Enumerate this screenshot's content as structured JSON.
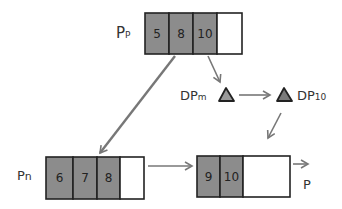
{
  "colors": {
    "filled": "#8c8c8c",
    "empty": "#ffffff",
    "stroke": "#222222",
    "arrow": "#777777",
    "triangle_m": "#9a9a9a",
    "triangle_10": "#7a7a7a"
  },
  "nodes": {
    "pp": {
      "label": "Pp",
      "label_main": "P",
      "label_sub": "P",
      "cells": [
        "5",
        "8",
        "10",
        ""
      ]
    },
    "pn": {
      "label": "Pn",
      "label_main": "P",
      "label_sub": "n",
      "cells": [
        "6",
        "7",
        "8",
        ""
      ]
    },
    "p": {
      "label": "P",
      "cells": [
        "9",
        "10",
        ""
      ]
    }
  },
  "triangles": {
    "dpm": {
      "label": "DPm",
      "label_main": "DP",
      "label_sub": "m"
    },
    "dp10": {
      "label": "DP10",
      "label_main": "DP",
      "label_sub": "10"
    }
  }
}
